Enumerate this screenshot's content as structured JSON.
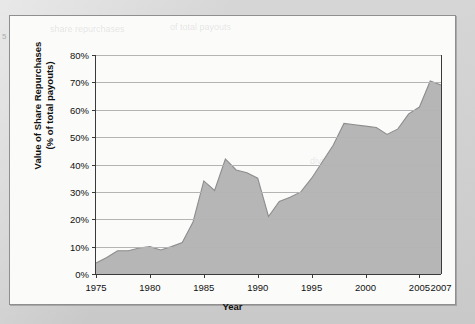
{
  "figure": {
    "margin_glyph": "5",
    "ghost_text": [
      "share repurchases",
      "of total payouts",
      "dividends"
    ]
  },
  "chart_data": {
    "type": "area",
    "title": "",
    "xlabel": "Year",
    "ylabel": "Value of Share Repurchases (% of total payouts)",
    "ylabel_line1": "Value of Share Repurchases",
    "ylabel_line2": "(% of total payouts)",
    "xlim": [
      1975,
      2007
    ],
    "ylim": [
      0,
      80
    ],
    "grid": true,
    "legend": "none",
    "fill_color": "#b6b6b6",
    "line_color": "#8d8d8d",
    "axis_color": "#3a3a3a",
    "gridline_color": "#b4b4b4",
    "ytick_labels": [
      "0%",
      "10%",
      "20%",
      "30%",
      "40%",
      "50%",
      "60%",
      "70%",
      "80%"
    ],
    "ytick_values": [
      0,
      10,
      20,
      30,
      40,
      50,
      60,
      70,
      80
    ],
    "xtick_labels": [
      "1975",
      "1980",
      "1985",
      "1990",
      "1995",
      "2000",
      "2005"
    ],
    "xtick_values": [
      1975,
      1980,
      1985,
      1990,
      1995,
      2000,
      2005
    ],
    "x_end_label": "2007",
    "x": [
      1975,
      1976,
      1977,
      1978,
      1979,
      1980,
      1981,
      1982,
      1983,
      1984,
      1985,
      1986,
      1987,
      1988,
      1989,
      1990,
      1991,
      1992,
      1993,
      1994,
      1995,
      1996,
      1997,
      1998,
      1999,
      2000,
      2001,
      2002,
      2003,
      2004,
      2005,
      2006,
      2007
    ],
    "values": [
      4,
      6,
      8.5,
      8.5,
      9.5,
      10,
      8.8,
      10,
      11.5,
      19,
      34,
      30.5,
      42,
      38,
      37,
      35,
      21,
      26.5,
      28,
      30,
      35,
      41,
      47,
      55,
      54.5,
      54,
      53.5,
      51,
      53,
      58.5,
      61,
      70.5,
      69
    ]
  }
}
